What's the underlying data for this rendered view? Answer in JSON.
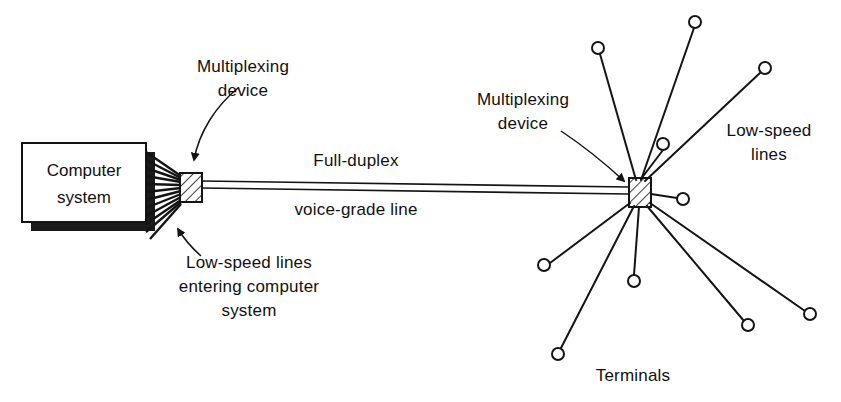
{
  "diagram": {
    "colors": {
      "line": "#141414",
      "text": "#111111",
      "background": "#ffffff",
      "shadow": "#1a1a1a",
      "box_fill": "#ffffff"
    },
    "computer_box": {
      "label_line_1": "Computer",
      "label_line_2": "system",
      "x": 22,
      "y": 143,
      "width": 124,
      "height": 79
    },
    "labels": {
      "multiplexing_device_left": {
        "line_1": "Multiplexing",
        "line_2": "device",
        "x": 243,
        "y": 72
      },
      "multiplexing_device_right": {
        "line_1": "Multiplexing",
        "line_2": "device",
        "x": 523,
        "y": 105
      },
      "trunk_top": {
        "text": "Full-duplex",
        "x": 356,
        "y": 166
      },
      "trunk_bottom": {
        "text": "voice-grade line",
        "x": 356,
        "y": 213
      },
      "low_speed_lines_left": {
        "line_1": "Low-speed lines",
        "line_2": "entering computer",
        "line_3": "system",
        "x": 249,
        "y": 268
      },
      "low_speed_lines_right": {
        "line_1": "Low-speed",
        "line_2": "lines",
        "x": 769,
        "y": 136
      },
      "terminals": {
        "text": "Terminals",
        "x": 633,
        "y": 381
      }
    },
    "multiplexer_left": {
      "name": "Left multiplexing device",
      "x": 180,
      "y": 173,
      "width": 22,
      "height": 29
    },
    "multiplexer_right": {
      "name": "Right multiplexing device",
      "x": 629,
      "y": 178,
      "width": 22,
      "height": 29
    },
    "trunk_line": {
      "name": "Full-duplex voice-grade line",
      "x1": 202,
      "y1": 184,
      "x2": 629,
      "y2": 190,
      "pair_offset": 6
    },
    "computer_fan_count": 11,
    "terminal_count": 10,
    "terminals": [
      {
        "id": "t1",
        "cx": 695,
        "cy": 22,
        "r": 6
      },
      {
        "id": "t2",
        "cx": 765,
        "cy": 68,
        "r": 6
      },
      {
        "id": "t3",
        "cx": 598,
        "cy": 48,
        "r": 6
      },
      {
        "id": "t4",
        "cx": 663,
        "cy": 144,
        "r": 6
      },
      {
        "id": "t5",
        "cx": 683,
        "cy": 199,
        "r": 6
      },
      {
        "id": "t6",
        "cx": 810,
        "cy": 314,
        "r": 6
      },
      {
        "id": "t7",
        "cx": 748,
        "cy": 325,
        "r": 6
      },
      {
        "id": "t8",
        "cx": 634,
        "cy": 281,
        "r": 6
      },
      {
        "id": "t9",
        "cx": 558,
        "cy": 354,
        "r": 6
      },
      {
        "id": "t10",
        "cx": 544,
        "cy": 265,
        "r": 6
      }
    ],
    "annotation_arrows": {
      "left_device_arrow": {
        "path": "M 238 88 C 218 104 200 130 194 158",
        "tip": "194,172"
      },
      "left_lowspeed_arrow": {
        "path": "M 200 257 C 190 249 183 242 178 232",
        "tip": "175,222"
      },
      "right_device_arrow": {
        "path": "M 560 130 C 585 146 608 166 622 182",
        "tip": "630,190"
      }
    }
  }
}
